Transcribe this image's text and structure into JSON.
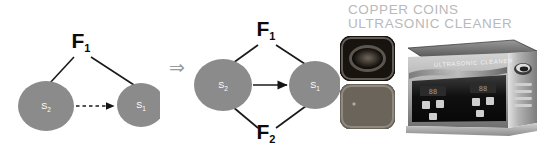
{
  "figure": {
    "panels": [
      {
        "id": "before",
        "name": "single-force-diagram",
        "nodes": [
          {
            "id": "s2",
            "label": "S",
            "sub": "2",
            "cx": 46,
            "cy": 106,
            "rx": 28,
            "ry": 25
          },
          {
            "id": "s1",
            "label": "S",
            "sub": "1",
            "cx": 141,
            "cy": 105,
            "rx": 24,
            "ry": 22
          }
        ],
        "forces": [
          {
            "id": "f1",
            "label": "F",
            "sub": "1",
            "x": 81,
            "y": 48
          }
        ],
        "edges": [
          {
            "from": "f1",
            "to": "s2",
            "style": "solid"
          },
          {
            "from": "f1",
            "to": "s1",
            "style": "solid"
          },
          {
            "from": "s2",
            "to": "s1",
            "style": "dashed",
            "arrow": true
          }
        ]
      },
      {
        "id": "after",
        "name": "two-force-diagram",
        "nodes": [
          {
            "id": "s2",
            "label": "S",
            "sub": "2",
            "cx": 33,
            "cy": 85,
            "rx": 29,
            "ry": 26
          },
          {
            "id": "s1",
            "label": "S",
            "sub": "1",
            "cx": 125,
            "cy": 85,
            "rx": 26,
            "ry": 24
          }
        ],
        "forces": [
          {
            "id": "f1",
            "label": "F",
            "sub": "1",
            "x": 76,
            "y": 36
          },
          {
            "id": "f2",
            "label": "F",
            "sub": "2",
            "x": 76,
            "y": 139
          }
        ],
        "edges": [
          {
            "from": "f1",
            "to": "s2",
            "style": "solid"
          },
          {
            "from": "f1",
            "to": "s1",
            "style": "solid"
          },
          {
            "from": "f2",
            "to": "s2",
            "style": "solid"
          },
          {
            "from": "f2",
            "to": "s1",
            "style": "solid"
          },
          {
            "from": "s2",
            "to": "s1",
            "style": "solid",
            "arrow": true
          }
        ]
      }
    ],
    "implies_symbol": "⇒",
    "colors": {
      "node_fill": "#8b8b8b",
      "node_label": "#ffffff",
      "edge": "#1a1a1a",
      "implies": "#9a9a9a",
      "background": "#ffffff"
    }
  },
  "product": {
    "title_line1": "COPPER COINS",
    "title_line2": "ULTRASONIC CLEANER",
    "title_color": "#b9b9b9",
    "device_brand": "ULTRASONIC CLEANER",
    "device_model": "CD-4800",
    "thumbnails": [
      {
        "id": "before",
        "caption": "tarnished-copper-coins-in-basket"
      },
      {
        "id": "after",
        "caption": "cleaned-copper-coins-in-tank"
      }
    ],
    "display_left": "88",
    "display_right": "88",
    "buttons": [
      "SET",
      "TIME",
      "TEMP",
      "START"
    ]
  }
}
